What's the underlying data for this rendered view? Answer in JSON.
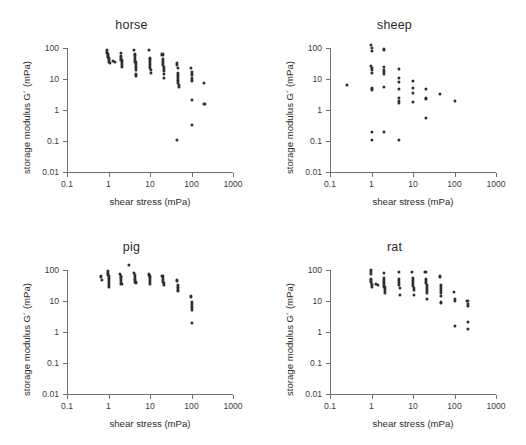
{
  "figure": {
    "axis_titles": {
      "x": "shear stress (mPa)",
      "y": "storage modulus G´ (mPa)"
    },
    "colors": {
      "point": "#2f2f2f",
      "axis": "#6f6f6f",
      "text": "#2b2b2b",
      "background": "#ffffff"
    },
    "x_tick_labels": [
      "0.1",
      "1",
      "10",
      "100",
      "1000"
    ],
    "y_tick_labels": [
      "100",
      "10",
      "1",
      "0.1",
      "0.01"
    ]
  },
  "chart_data": [
    {
      "type": "scatter",
      "title": "horse",
      "xlabel": "shear stress (mPa)",
      "ylabel": "storage modulus G´ (mPa)",
      "xscale": "log",
      "yscale": "log",
      "xlim": [
        0.1,
        1000
      ],
      "ylim": [
        0.01,
        100
      ],
      "xticks": [
        0.1,
        1,
        10,
        100,
        1000
      ],
      "yticks": [
        0.01,
        0.1,
        1,
        10,
        100
      ],
      "grid": false,
      "legend": "none",
      "points": [
        [
          0.93,
          84
        ],
        [
          0.93,
          72
        ],
        [
          0.95,
          62
        ],
        [
          0.97,
          57
        ],
        [
          0.99,
          52
        ],
        [
          1.0,
          48
        ],
        [
          1.0,
          44
        ],
        [
          1.02,
          40
        ],
        [
          1.05,
          36
        ],
        [
          1.08,
          33
        ],
        [
          1.3,
          38
        ],
        [
          1.45,
          36
        ],
        [
          1.95,
          70
        ],
        [
          2.0,
          57
        ],
        [
          2.0,
          50
        ],
        [
          2.02,
          45
        ],
        [
          2.05,
          41
        ],
        [
          2.08,
          37
        ],
        [
          2.1,
          32
        ],
        [
          2.12,
          28
        ],
        [
          2.15,
          25
        ],
        [
          4.2,
          88
        ],
        [
          4.3,
          62
        ],
        [
          4.3,
          55
        ],
        [
          4.4,
          48
        ],
        [
          4.4,
          42
        ],
        [
          4.45,
          36
        ],
        [
          4.5,
          31
        ],
        [
          4.5,
          27
        ],
        [
          4.55,
          23
        ],
        [
          4.6,
          19
        ],
        [
          4.6,
          15
        ],
        [
          4.7,
          13
        ],
        [
          9.5,
          86
        ],
        [
          9.8,
          46
        ],
        [
          9.9,
          40
        ],
        [
          10.0,
          35
        ],
        [
          10.0,
          30
        ],
        [
          10.1,
          26
        ],
        [
          10.2,
          22
        ],
        [
          10.3,
          19
        ],
        [
          10.4,
          16
        ],
        [
          20,
          62
        ],
        [
          20.5,
          44
        ],
        [
          20.5,
          38
        ],
        [
          21,
          33
        ],
        [
          21,
          29
        ],
        [
          21.2,
          25
        ],
        [
          21.5,
          21
        ],
        [
          21.8,
          18
        ],
        [
          22,
          15
        ],
        [
          22,
          11
        ],
        [
          45,
          34
        ],
        [
          45,
          29
        ],
        [
          46,
          22
        ],
        [
          46,
          16
        ],
        [
          47,
          13
        ],
        [
          47,
          11
        ],
        [
          48,
          9.0
        ],
        [
          48,
          7.6
        ],
        [
          49,
          6.3
        ],
        [
          49,
          5.4
        ],
        [
          45,
          0.105
        ],
        [
          98,
          22
        ],
        [
          100,
          17
        ],
        [
          100,
          14
        ],
        [
          102,
          11
        ],
        [
          104,
          9.0
        ],
        [
          100,
          2.1
        ],
        [
          102,
          0.33
        ],
        [
          200,
          7.4
        ],
        [
          205,
          1.6
        ]
      ]
    },
    {
      "type": "scatter",
      "title": "sheep",
      "xlabel": "shear stress (mPa)",
      "ylabel": "storage modulus G´ (mPa)",
      "xscale": "log",
      "yscale": "log",
      "xlim": [
        0.1,
        1000
      ],
      "ylim": [
        0.01,
        100
      ],
      "xticks": [
        0.1,
        1,
        10,
        100,
        1000
      ],
      "yticks": [
        0.01,
        0.1,
        1,
        10,
        100
      ],
      "grid": false,
      "legend": "none",
      "points": [
        [
          0.26,
          6.4
        ],
        [
          0.98,
          125
        ],
        [
          1.02,
          100
        ],
        [
          1.0,
          78
        ],
        [
          0.98,
          26
        ],
        [
          1.0,
          22
        ],
        [
          1.02,
          19
        ],
        [
          1.0,
          16
        ],
        [
          1.0,
          5.0
        ],
        [
          1.02,
          4.6
        ],
        [
          1.0,
          0.2
        ],
        [
          1.0,
          0.105
        ],
        [
          2.0,
          90
        ],
        [
          1.98,
          24
        ],
        [
          2.0,
          20
        ],
        [
          2.02,
          17
        ],
        [
          2.0,
          15
        ],
        [
          2.0,
          5.4
        ],
        [
          2.0,
          0.2
        ],
        [
          4.6,
          21
        ],
        [
          4.6,
          11
        ],
        [
          4.6,
          8.2
        ],
        [
          4.7,
          4.8
        ],
        [
          4.7,
          2.4
        ],
        [
          4.7,
          1.9
        ],
        [
          4.7,
          1.7
        ],
        [
          4.7,
          0.105
        ],
        [
          9.8,
          8.4
        ],
        [
          10.0,
          5.0
        ],
        [
          10.0,
          3.6
        ],
        [
          10.2,
          1.8
        ],
        [
          21,
          4.7
        ],
        [
          21,
          2.4
        ],
        [
          21,
          2.2
        ],
        [
          21,
          0.55
        ],
        [
          45,
          3.2
        ],
        [
          100,
          2.0
        ]
      ]
    },
    {
      "type": "scatter",
      "title": "pig",
      "xlabel": "shear stress (mPa)",
      "ylabel": "storage modulus G´ (mPa)",
      "xscale": "log",
      "yscale": "log",
      "xlim": [
        0.1,
        1000
      ],
      "ylim": [
        0.01,
        100
      ],
      "xticks": [
        0.1,
        1,
        10,
        100,
        1000
      ],
      "yticks": [
        0.01,
        0.1,
        1,
        10,
        100
      ],
      "grid": false,
      "legend": "none",
      "points": [
        [
          0.66,
          62
        ],
        [
          0.68,
          48
        ],
        [
          0.95,
          92
        ],
        [
          0.97,
          80
        ],
        [
          0.98,
          72
        ],
        [
          1.0,
          64
        ],
        [
          1.0,
          56
        ],
        [
          1.0,
          50
        ],
        [
          1.02,
          44
        ],
        [
          1.02,
          38
        ],
        [
          1.04,
          33
        ],
        [
          1.05,
          29
        ],
        [
          1.9,
          74
        ],
        [
          1.95,
          62
        ],
        [
          2.0,
          54
        ],
        [
          2.0,
          47
        ],
        [
          2.02,
          41
        ],
        [
          2.05,
          36
        ],
        [
          3.1,
          150
        ],
        [
          4.2,
          78
        ],
        [
          4.3,
          68
        ],
        [
          4.3,
          60
        ],
        [
          4.4,
          53
        ],
        [
          4.4,
          47
        ],
        [
          4.45,
          42
        ],
        [
          4.5,
          37
        ],
        [
          9.6,
          72
        ],
        [
          9.8,
          62
        ],
        [
          10.0,
          54
        ],
        [
          10.0,
          47
        ],
        [
          10.1,
          41
        ],
        [
          10.2,
          36
        ],
        [
          20,
          66
        ],
        [
          20.5,
          56
        ],
        [
          21,
          48
        ],
        [
          21,
          42
        ],
        [
          21.2,
          37
        ],
        [
          21.5,
          32
        ],
        [
          45,
          46
        ],
        [
          46,
          33
        ],
        [
          46,
          29
        ],
        [
          47,
          26
        ],
        [
          47,
          23
        ],
        [
          48,
          21
        ],
        [
          98,
          14
        ],
        [
          100,
          9.5
        ],
        [
          100,
          8.0
        ],
        [
          100,
          6.8
        ],
        [
          102,
          5.8
        ],
        [
          102,
          5.0
        ],
        [
          100,
          1.95
        ]
      ]
    },
    {
      "type": "scatter",
      "title": "rat",
      "xlabel": "shear stress (mPa)",
      "ylabel": "storage modulus G´ (mPa)",
      "xscale": "log",
      "yscale": "log",
      "xlim": [
        0.1,
        1000
      ],
      "ylim": [
        0.01,
        100
      ],
      "xticks": [
        0.1,
        1,
        10,
        100,
        1000
      ],
      "yticks": [
        0.01,
        0.1,
        1,
        10,
        100
      ],
      "grid": false,
      "legend": "none",
      "points": [
        [
          0.95,
          98
        ],
        [
          0.97,
          86
        ],
        [
          0.98,
          76
        ],
        [
          0.95,
          52
        ],
        [
          0.97,
          46
        ],
        [
          0.99,
          41
        ],
        [
          1.0,
          36
        ],
        [
          1.0,
          32
        ],
        [
          1.02,
          28
        ],
        [
          1.3,
          36
        ],
        [
          1.4,
          33
        ],
        [
          1.95,
          82
        ],
        [
          1.98,
          56
        ],
        [
          2.0,
          48
        ],
        [
          2.0,
          42
        ],
        [
          2.02,
          37
        ],
        [
          2.04,
          32
        ],
        [
          2.05,
          28
        ],
        [
          2.06,
          24
        ],
        [
          2.08,
          21
        ],
        [
          2.1,
          18
        ],
        [
          4.5,
          84
        ],
        [
          4.6,
          52
        ],
        [
          4.6,
          44
        ],
        [
          4.7,
          38
        ],
        [
          4.7,
          32
        ],
        [
          4.8,
          27
        ],
        [
          4.8,
          16
        ],
        [
          9.6,
          84
        ],
        [
          9.8,
          56
        ],
        [
          10.0,
          48
        ],
        [
          10.0,
          42
        ],
        [
          10.1,
          36
        ],
        [
          10.2,
          31
        ],
        [
          10.3,
          26
        ],
        [
          10.4,
          22
        ],
        [
          10.5,
          16
        ],
        [
          20,
          88
        ],
        [
          20.5,
          50
        ],
        [
          21,
          44
        ],
        [
          21,
          38
        ],
        [
          21.2,
          33
        ],
        [
          21.4,
          29
        ],
        [
          21.6,
          25
        ],
        [
          21.8,
          21
        ],
        [
          22,
          18
        ],
        [
          22,
          12
        ],
        [
          45,
          62
        ],
        [
          46,
          34
        ],
        [
          46,
          28
        ],
        [
          47,
          24
        ],
        [
          47,
          21
        ],
        [
          48,
          18
        ],
        [
          48,
          15
        ],
        [
          48,
          9.0
        ],
        [
          98,
          20
        ],
        [
          100,
          12
        ],
        [
          100,
          10
        ],
        [
          100,
          1.6
        ],
        [
          205,
          10
        ],
        [
          208,
          8.0
        ],
        [
          208,
          7.0
        ],
        [
          208,
          2.1
        ],
        [
          210,
          1.25
        ]
      ]
    }
  ]
}
